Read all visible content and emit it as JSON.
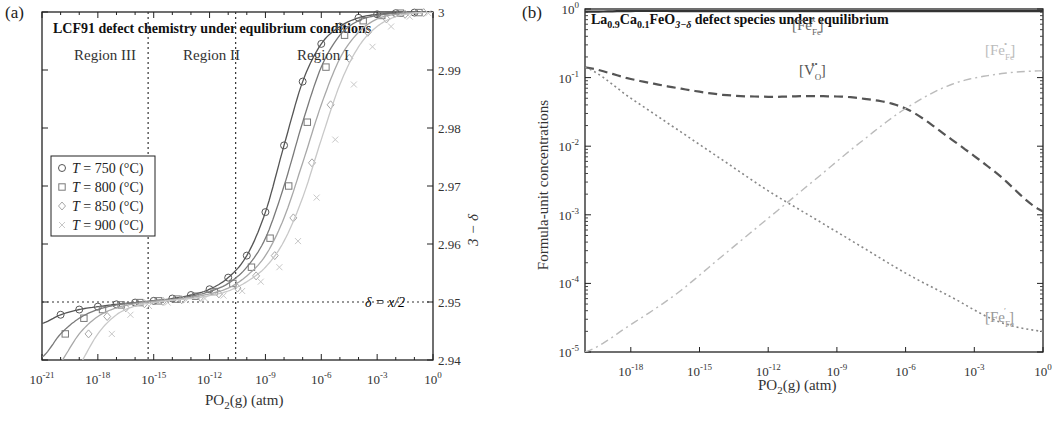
{
  "figure": {
    "panel_a": {
      "label": "(a)",
      "title": "LCF91 defect chemistry under equlibrium conditions",
      "xlabel_main": "PO",
      "xlabel_sub": "2",
      "xlabel_rest": "(g) (atm)",
      "ylabel": "3 − δ",
      "regions": [
        "Region III",
        "Region II",
        "Region I"
      ],
      "delta_annotation": "δ = x/2",
      "legend": [
        {
          "marker": "circle",
          "text": "T = 750 (°C)",
          "color": "#555555"
        },
        {
          "marker": "square",
          "text": "T = 800 (°C)",
          "color": "#7a7a7a"
        },
        {
          "marker": "diamond",
          "text": "T = 850 (°C)",
          "color": "#a8a8a8"
        },
        {
          "marker": "cross",
          "text": "T = 900 (°C)",
          "color": "#c8c8c8"
        }
      ]
    },
    "panel_b": {
      "label": "(b)",
      "title_parts": [
        "La",
        "0.9",
        "Ca",
        "0.1",
        "FeO",
        "3−δ",
        " defect species under equilibrium"
      ],
      "xlabel_main": "PO",
      "xlabel_sub": "2",
      "xlabel_rest": "(g) (atm)",
      "ylabel": "Formula-unit concentrations",
      "annotations": [
        {
          "id": "fe_fe_x",
          "base": "[Fe",
          "sub": "Fe",
          "sup": "x",
          "close": "]",
          "color": "#666666"
        },
        {
          "id": "v_o",
          "base": "[V",
          "sub": "O",
          "sup": "••",
          "close": "]",
          "color": "#555555"
        },
        {
          "id": "fe_fe_dot",
          "base": "[Fe",
          "sub": "Fe",
          "sup": "•",
          "close": "]",
          "color": "#bbbbbb"
        },
        {
          "id": "fe_fe_prime",
          "base": "[Fe",
          "sub": "Fe",
          "sup": "′",
          "close": "]",
          "color": "#999999"
        }
      ]
    }
  },
  "chart_data": [
    {
      "type": "line",
      "title": "LCF91 defect chemistry under equlibrium conditions",
      "xlabel": "PO2(g) (atm)",
      "ylabel": "3 − δ",
      "xscale": "log",
      "xlim_exp": [
        -21,
        0
      ],
      "ylim": [
        2.94,
        3.0
      ],
      "xticks": [
        "10^-21",
        "10^-18",
        "10^-15",
        "10^-12",
        "10^-9",
        "10^-6",
        "10^-3",
        "10^0"
      ],
      "yticks": [
        2.94,
        2.95,
        2.96,
        2.97,
        2.98,
        2.99,
        3
      ],
      "yaxis_position": "right",
      "reference_lines": {
        "vertical_log10": [
          -15.3,
          -10.6
        ],
        "horizontal": 2.95
      },
      "legend_position": "upper left",
      "x_log10": [
        -21,
        -20,
        -19,
        -18,
        -17,
        -16,
        -15,
        -14,
        -13,
        -12,
        -11,
        -10,
        -9,
        -8,
        -7,
        -6,
        -5,
        -4,
        -3,
        -2,
        -1,
        0
      ],
      "series": [
        {
          "name": "T = 750 (°C)",
          "marker": "circle",
          "values": [
            2.9463,
            2.9478,
            2.9487,
            2.9492,
            2.9496,
            2.9499,
            2.9502,
            2.9506,
            2.9512,
            2.9522,
            2.9542,
            2.958,
            2.9655,
            2.977,
            2.988,
            2.9945,
            2.9975,
            2.999,
            2.9996,
            2.9998,
            2.9999,
            3.0
          ]
        },
        {
          "name": "T = 800 (°C)",
          "marker": "square",
          "values": [
            2.9405,
            2.9445,
            2.9472,
            2.9487,
            2.9495,
            2.9499,
            2.9502,
            2.9505,
            2.951,
            2.9518,
            2.9532,
            2.956,
            2.961,
            2.97,
            2.981,
            2.9905,
            2.996,
            2.9985,
            2.9994,
            2.9998,
            2.9999,
            3.0
          ]
        },
        {
          "name": "T = 850 (°C)",
          "marker": "diamond",
          "values": [
            2.935,
            2.9395,
            2.9445,
            2.9475,
            2.949,
            2.9497,
            2.9501,
            2.9504,
            2.9508,
            2.9514,
            2.9524,
            2.9545,
            2.958,
            2.9645,
            2.974,
            2.984,
            2.992,
            2.9965,
            2.9988,
            2.9996,
            2.9999,
            3.0
          ]
        },
        {
          "name": "T = 900 (°C)",
          "marker": "cross",
          "values": [
            2.93,
            2.934,
            2.939,
            2.9445,
            2.9478,
            2.9493,
            2.9499,
            2.9503,
            2.9506,
            2.9511,
            2.9519,
            2.9535,
            2.956,
            2.9605,
            2.968,
            2.978,
            2.9875,
            2.994,
            2.9975,
            2.9992,
            2.9998,
            3.0
          ]
        }
      ]
    },
    {
      "type": "line",
      "title": "La0.9Ca0.1FeO3−δ defect species under equilibrium",
      "xlabel": "PO2(g) (atm)",
      "ylabel": "Formula-unit concentrations",
      "xscale": "log",
      "yscale": "log",
      "xlim_exp": [
        -20,
        0
      ],
      "ylim_exp": [
        -5,
        0
      ],
      "xticks": [
        "10^-18",
        "10^-15",
        "10^-12",
        "10^-9",
        "10^-6",
        "10^-3",
        "10^0"
      ],
      "yticks": [
        "10^-5",
        "10^-4",
        "10^-3",
        "10^-2",
        "10^-1",
        "10^0"
      ],
      "x_log10": [
        -20,
        -18,
        -16,
        -14,
        -12,
        -10,
        -8,
        -6,
        -4,
        -2,
        0
      ],
      "series": [
        {
          "name": "[Fe_Fe^x]",
          "style": "solid",
          "color": "#333333",
          "log10_values": [
            -0.04,
            -0.03,
            -0.03,
            -0.03,
            -0.03,
            -0.03,
            -0.03,
            -0.03,
            -0.03,
            -0.03,
            -0.03
          ]
        },
        {
          "name": "[V_O^••]",
          "style": "dashed",
          "color": "#555555",
          "log10_values": [
            -0.85,
            -1.02,
            -1.15,
            -1.25,
            -1.28,
            -1.27,
            -1.3,
            -1.45,
            -1.9,
            -2.4,
            -2.95
          ]
        },
        {
          "name": "[Fe_Fe^•]",
          "style": "dashdot",
          "color": "#bbbbbb",
          "log10_values": [
            -5.0,
            -4.6,
            -4.15,
            -3.6,
            -3.05,
            -2.5,
            -1.95,
            -1.45,
            -1.1,
            -0.95,
            -0.9
          ]
        },
        {
          "name": "[Fe_Fe^′]",
          "style": "dotted",
          "color": "#888888",
          "log10_values": [
            -0.85,
            -1.3,
            -1.75,
            -2.2,
            -2.65,
            -3.05,
            -3.45,
            -3.85,
            -4.2,
            -4.55,
            -4.7
          ]
        }
      ]
    }
  ]
}
